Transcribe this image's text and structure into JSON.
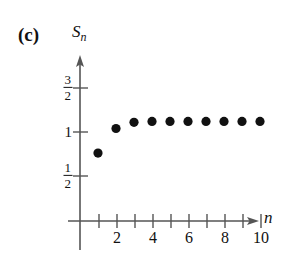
{
  "figure": {
    "part_label": "(c)",
    "background_color": "#ffffff",
    "ink_color": "#111111",
    "axis_color": "#555555"
  },
  "chart_data": {
    "type": "scatter",
    "title": "",
    "subtitle": "",
    "xlabel": "n",
    "ylabel": "S_n",
    "ylabel_base": "S",
    "ylabel_sub": "n",
    "grid": false,
    "legend": false,
    "legend_position": "none",
    "xlim": [
      0,
      11
    ],
    "ylim": [
      0,
      1.75
    ],
    "x": [
      1,
      2,
      3,
      4,
      5,
      6,
      7,
      8,
      9,
      10
    ],
    "values": [
      0.76,
      1.04,
      1.11,
      1.12,
      1.12,
      1.12,
      1.12,
      1.12,
      1.12,
      1.12
    ],
    "series": [
      {
        "name": "S_n",
        "marker": "filled-circle",
        "marker_color": "#111111",
        "marker_radius": 4.6,
        "values": [
          0.76,
          1.04,
          1.11,
          1.12,
          1.12,
          1.12,
          1.12,
          1.12,
          1.12,
          1.12
        ]
      }
    ],
    "xticks": [
      1,
      2,
      3,
      4,
      5,
      6,
      7,
      8,
      9,
      10
    ],
    "xtick_labels": [
      {
        "value": 2,
        "text": "2"
      },
      {
        "value": 4,
        "text": "4"
      },
      {
        "value": 6,
        "text": "6"
      },
      {
        "value": 8,
        "text": "8"
      },
      {
        "value": 10,
        "text": "10"
      }
    ],
    "yticks": [
      0.5,
      1.0,
      1.5
    ],
    "ytick_labels": [
      {
        "value": 1.5,
        "text": "3/2",
        "numerator": "3",
        "denominator": "2",
        "is_fraction": true
      },
      {
        "value": 1.0,
        "text": "1",
        "numerator": "1",
        "denominator": "",
        "is_fraction": false
      },
      {
        "value": 0.5,
        "text": "1/2",
        "numerator": "1",
        "denominator": "2",
        "is_fraction": true
      }
    ],
    "annotations": []
  }
}
